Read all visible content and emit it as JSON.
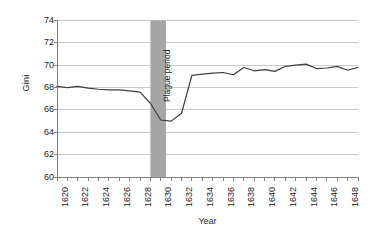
{
  "chart_data": {
    "type": "line",
    "title": "",
    "xlabel": "Year",
    "ylabel": "Gini",
    "xlim": [
      1620,
      1649
    ],
    "ylim": [
      60,
      74
    ],
    "yticks": [
      60,
      62,
      64,
      66,
      68,
      70,
      72,
      74
    ],
    "xticks": [
      1620,
      1622,
      1624,
      1626,
      1628,
      1630,
      1632,
      1634,
      1636,
      1638,
      1640,
      1642,
      1644,
      1646,
      1648
    ],
    "xtick_labels": [
      "1620",
      "1622",
      "1624",
      "1626",
      "1628",
      "1630",
      "1632",
      "1634",
      "1636",
      "1638",
      "1640",
      "1642",
      "1644",
      "1646",
      "1648"
    ],
    "ytick_labels": [
      "60",
      "62",
      "64",
      "66",
      "68",
      "70",
      "72",
      "74"
    ],
    "grid": "horizontal",
    "legend": "none",
    "line_color": "#3f3f3f",
    "grid_color": "#c9c9c9",
    "axis_color": "#808080",
    "band_color": "#a6a6a6",
    "x": [
      1620,
      1621,
      1622,
      1623,
      1624,
      1625,
      1626,
      1627,
      1628,
      1629,
      1630,
      1631,
      1632,
      1633,
      1634,
      1635,
      1636,
      1637,
      1638,
      1639,
      1640,
      1641,
      1642,
      1643,
      1644,
      1645,
      1646,
      1647,
      1648,
      1649
    ],
    "values": [
      68.1,
      68.0,
      68.1,
      67.95,
      67.85,
      67.8,
      67.8,
      67.7,
      67.6,
      66.6,
      65.1,
      65.0,
      65.7,
      69.1,
      69.2,
      69.3,
      69.35,
      69.15,
      69.8,
      69.5,
      69.6,
      69.45,
      69.9,
      70.0,
      70.1,
      69.7,
      69.75,
      69.9,
      69.55,
      69.8
    ],
    "annotations": [
      {
        "label": "Plague period",
        "type": "vertical-band",
        "x_start": 1629.0,
        "x_end": 1630.5,
        "color": "#a6a6a6"
      }
    ]
  }
}
